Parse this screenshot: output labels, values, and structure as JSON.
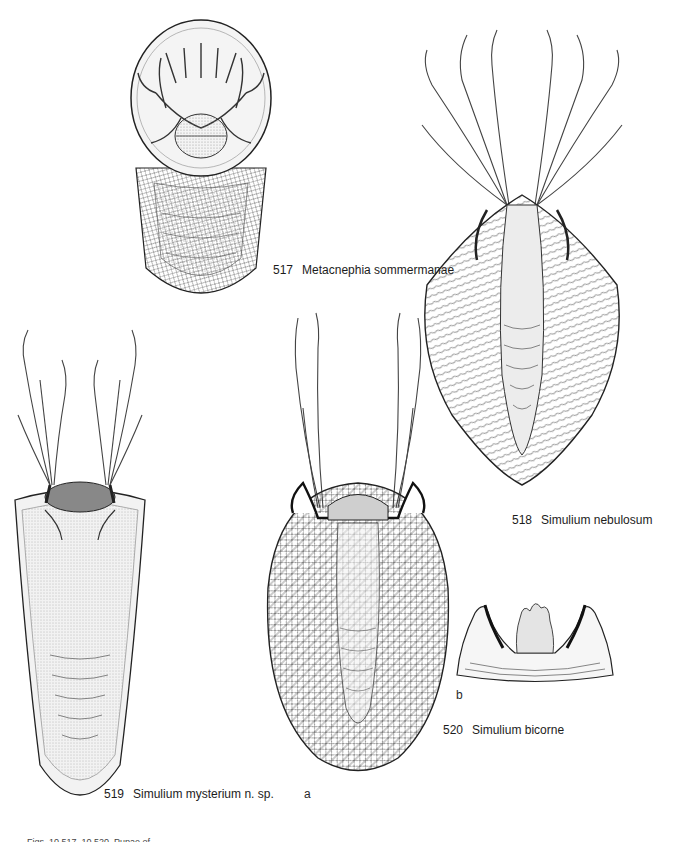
{
  "plate": {
    "figures": [
      {
        "number": "517",
        "name": "Metacnephia sommermanae"
      },
      {
        "number": "518",
        "name": "Simulium nebulosum"
      },
      {
        "number": "519",
        "name": "Simulium mysterium n. sp."
      },
      {
        "number": "520",
        "name": "Simulium bicorne"
      }
    ],
    "sublabels": {
      "a": "a",
      "b": "b"
    },
    "caption": "Figs. 10.517–10.520. Pupae of..."
  },
  "colors": {
    "ink": "#1a1a1a",
    "paper": "#ffffff",
    "cocoon_fill": "#f1f1f1",
    "stipple": "#9a9a9a"
  }
}
